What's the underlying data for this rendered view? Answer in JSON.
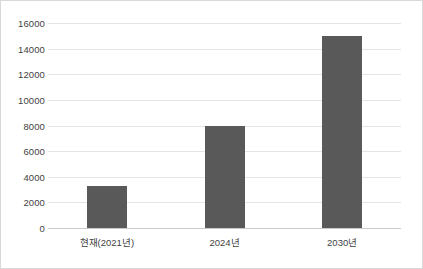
{
  "chart_data": {
    "type": "bar",
    "title": "",
    "subtitle": "",
    "xlabel": "",
    "ylabel": "",
    "categories": [
      "현재(2021년)",
      "2024년",
      "2030년"
    ],
    "values": [
      3300,
      8000,
      15000
    ],
    "series": [
      {
        "name": "",
        "values": [
          3300,
          8000,
          15000
        ]
      }
    ],
    "ylim": [
      0,
      16000
    ],
    "ytick_step": 2000,
    "ytick_labels": [
      "0",
      "2000",
      "4000",
      "6000",
      "8000",
      "10000",
      "12000",
      "14000",
      "16000"
    ],
    "ytick_values": [
      0,
      2000,
      4000,
      6000,
      8000,
      10000,
      12000,
      14000,
      16000
    ],
    "grid": true,
    "grid_axis": "y",
    "legend": false,
    "legend_position": "none",
    "annotations": [],
    "colors": {
      "bar_fill": "#595959",
      "gridline": "#e4e4e4",
      "axis_line": "#c9c9c9",
      "frame_border": "#d9d9d9",
      "tick_label": "#3f3f3f",
      "background": "#ffffff"
    }
  }
}
